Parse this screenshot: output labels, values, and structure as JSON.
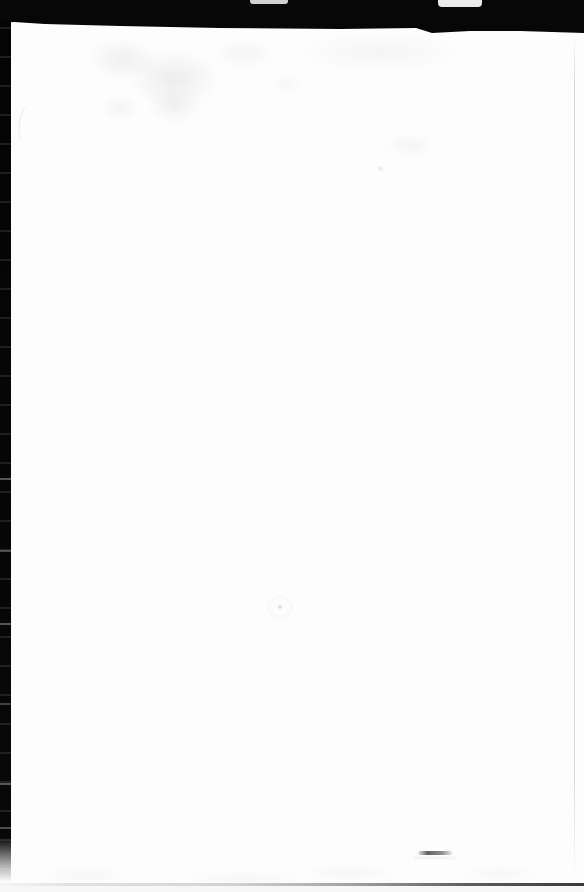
{
  "document": {
    "kind": "scanned-book-page",
    "visible_text": ""
  },
  "colors": {
    "scan_border": "#070707",
    "page_background": "#fdfdfd",
    "page_edge_line": "#c9c9c9",
    "bottom_edge_dark": "#2e2e2e",
    "pencil_mark": "#5a5a5a"
  }
}
